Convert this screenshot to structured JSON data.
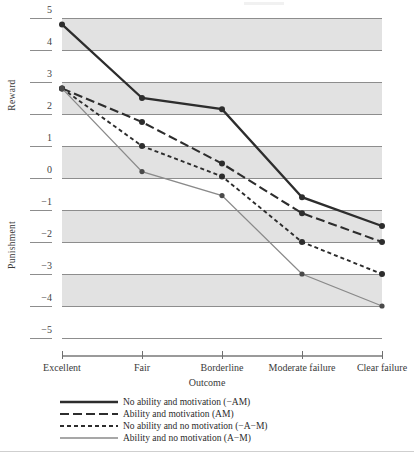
{
  "axes": {
    "y_upper_label": "Reward",
    "y_lower_label": "Punishment",
    "x_title": "Outcome",
    "y_ticks": [
      "5",
      "4",
      "3",
      "2",
      "1",
      "0",
      "−1",
      "−2",
      "−3",
      "−4",
      "−5"
    ],
    "x_ticks": [
      "Excellent",
      "Fair",
      "Borderline",
      "Moderate failure",
      "Clear failure"
    ]
  },
  "legend": {
    "items": [
      {
        "label": "No ability and motivation (−AM)",
        "style": "solid-thick",
        "color": "#2d2d2d"
      },
      {
        "label": "Ability and motivation (AM)",
        "style": "dashed-long",
        "color": "#2d2d2d"
      },
      {
        "label": "No ability and no motivation (−A−M)",
        "style": "dashed-short",
        "color": "#2d2d2d"
      },
      {
        "label": "Ability and no motivation (A−M)",
        "style": "solid-thin",
        "color": "#8a8a8a"
      }
    ]
  },
  "colors": {
    "band": "#e2e2e2",
    "gridline": "#8d8d8d",
    "dark_line": "#2d2d2d",
    "gray_line": "#8a8a8a",
    "text": "#2b2b2b"
  },
  "chart_data": {
    "type": "line",
    "title": "",
    "xlabel": "Outcome",
    "ylabel": "Reward / Punishment",
    "categories": [
      "Excellent",
      "Fair",
      "Borderline",
      "Moderate failure",
      "Clear failure"
    ],
    "ylim": [
      -5,
      5
    ],
    "ytick_values": [
      5,
      4,
      3,
      2,
      1,
      0,
      -1,
      -2,
      -3,
      -4,
      -5
    ],
    "grid": true,
    "legend_position": "below-axis",
    "series": [
      {
        "name": "No ability and motivation (−AM)",
        "short": "−AM",
        "style": "solid-thick",
        "color": "#2d2d2d",
        "values": [
          4.8,
          2.5,
          2.15,
          -0.6,
          -1.5
        ]
      },
      {
        "name": "Ability and motivation (AM)",
        "short": "AM",
        "style": "dashed-long",
        "color": "#2d2d2d",
        "values": [
          2.8,
          1.75,
          0.45,
          -1.1,
          -2.0
        ]
      },
      {
        "name": "No ability and no motivation (−A−M)",
        "short": "−A−M",
        "style": "dashed-short",
        "color": "#2d2d2d",
        "values": [
          2.8,
          1.0,
          0.05,
          -2.0,
          -3.0
        ]
      },
      {
        "name": "Ability and no motivation (A−M)",
        "short": "A−M",
        "style": "solid-thin",
        "color": "#8a8a8a",
        "values": [
          2.8,
          0.2,
          -0.55,
          -3.0,
          -4.0
        ]
      }
    ]
  }
}
